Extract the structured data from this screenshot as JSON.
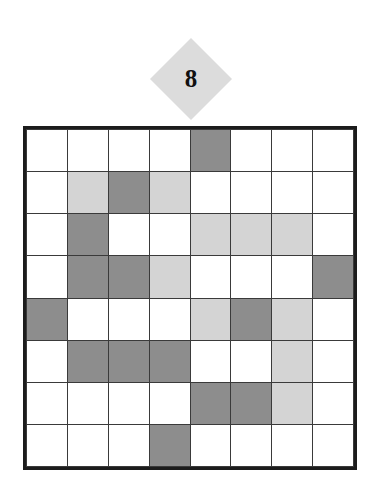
{
  "badge": {
    "label": "8",
    "shape": "diamond",
    "fill": "#dcdcdc",
    "text_color": "#111111"
  },
  "legend": {
    "white": "empty",
    "dark": "filled-dark",
    "light": "filled-light"
  },
  "palette": {
    "white": "#ffffff",
    "dark": "#8d8d8d",
    "light": "#d4d4d4",
    "frame": "#1c1c1c",
    "gridline": "#3a3a3a"
  },
  "grid": {
    "rows": 8,
    "cols": 8,
    "cells": [
      [
        "white",
        "white",
        "white",
        "white",
        "dark",
        "white",
        "white",
        "white"
      ],
      [
        "white",
        "light",
        "dark",
        "light",
        "white",
        "white",
        "white",
        "white"
      ],
      [
        "white",
        "dark",
        "white",
        "white",
        "light",
        "light",
        "light",
        "white"
      ],
      [
        "white",
        "dark",
        "dark",
        "light",
        "white",
        "white",
        "white",
        "dark"
      ],
      [
        "dark",
        "white",
        "white",
        "white",
        "light",
        "dark",
        "light",
        "white"
      ],
      [
        "white",
        "dark",
        "dark",
        "dark",
        "white",
        "white",
        "light",
        "white"
      ],
      [
        "white",
        "white",
        "white",
        "white",
        "dark",
        "dark",
        "light",
        "white"
      ],
      [
        "white",
        "white",
        "white",
        "dark",
        "white",
        "white",
        "white",
        "white"
      ]
    ]
  }
}
